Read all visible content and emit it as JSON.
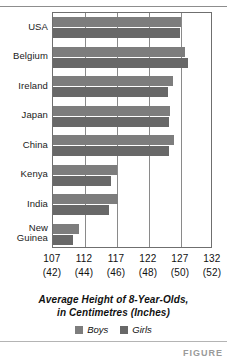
{
  "chart_data": {
    "type": "bar",
    "orientation": "horizontal",
    "title": "Average Height of 8-Year-Olds, in Centimetres (Inches)",
    "title_line1": "Average Height of 8-Year-Olds,",
    "title_line2": "in Centimetres (Inches)",
    "xlabel": "",
    "ylabel": "",
    "categories": [
      "USA",
      "Belgium",
      "Ireland",
      "Japan",
      "China",
      "Kenya",
      "India",
      "New Guinea"
    ],
    "series": [
      {
        "name": "Boys",
        "color": "#7d7d7d",
        "values": [
          127.0,
          127.7,
          125.8,
          125.3,
          125.9,
          117.0,
          117.2,
          111.1
        ]
      },
      {
        "name": "Girls",
        "color": "#686868",
        "values": [
          126.9,
          128.1,
          125.0,
          125.2,
          125.2,
          116.0,
          115.7,
          110.1
        ]
      }
    ],
    "xlim": [
      107,
      132
    ],
    "xticks": [
      107,
      112,
      117,
      122,
      127,
      132
    ],
    "xticks_inches": [
      "(42)",
      "(44)",
      "(46)",
      "(48)",
      "(50)",
      "(52)"
    ],
    "grid": true,
    "legend_position": "bottom"
  },
  "legend": [
    {
      "label": "Boys",
      "color": "#7d7d7d",
      "swatch": "legend-swatch-boys"
    },
    {
      "label": "Girls",
      "color": "#686868",
      "swatch": "legend-swatch-girls"
    }
  ],
  "figure_note": "FIGURE"
}
